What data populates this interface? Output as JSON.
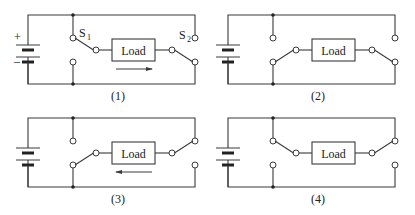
{
  "figure": {
    "load_label": "Load",
    "switch_labels": {
      "s1": "S",
      "s1_sub": "1",
      "s2": "S",
      "s2_sub": "2"
    },
    "battery_signs": {
      "plus": "+",
      "minus": "–"
    },
    "colors": {
      "line": "#3a3a3a",
      "background": "#ffffff"
    },
    "panels": [
      {
        "id": 1,
        "caption": "(1)",
        "ox": 0,
        "oy": 0,
        "left_switch": "up",
        "right_switch": "down",
        "show_switch_labels": true,
        "show_battery_signs": true,
        "current_arrow": "right"
      },
      {
        "id": 2,
        "caption": "(2)",
        "ox": 200,
        "oy": 0,
        "left_switch": "down",
        "right_switch": "down",
        "show_switch_labels": false,
        "show_battery_signs": false,
        "current_arrow": "none"
      },
      {
        "id": 3,
        "caption": "(3)",
        "ox": 0,
        "oy": 103,
        "left_switch": "down",
        "right_switch": "up",
        "show_switch_labels": false,
        "show_battery_signs": false,
        "current_arrow": "left"
      },
      {
        "id": 4,
        "caption": "(4)",
        "ox": 200,
        "oy": 103,
        "left_switch": "up",
        "right_switch": "up",
        "show_switch_labels": false,
        "show_battery_signs": false,
        "current_arrow": "none"
      }
    ]
  }
}
